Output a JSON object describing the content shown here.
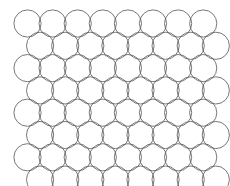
{
  "canvas": {
    "width": 230,
    "height": 186,
    "background_color": "#ffffff"
  },
  "diagram": {
    "shape": "circle",
    "stroke_color": "#555555",
    "stroke_width": 0.8,
    "fill": "none",
    "radius": 13.6,
    "row_count": 8,
    "columns_per_row": 8,
    "x_pitch": 25.1,
    "y_pitch": 22.3,
    "origin_x": 27.5,
    "origin_y": 23.5,
    "odd_row_offset": 12.55,
    "lattice": "hexagonal-close-packed",
    "total_circles": 64
  },
  "chart_data": {
    "type": "scatter",
    "title": "",
    "xlabel": "",
    "ylabel": "",
    "grid": false,
    "legend": null,
    "xlim": [
      0,
      230
    ],
    "ylim": [
      0,
      186
    ],
    "marker": "open-circle",
    "marker_radius": 13.6,
    "centers": [
      [
        27.5,
        23.5
      ],
      [
        52.6,
        23.5
      ],
      [
        77.7,
        23.5
      ],
      [
        102.8,
        23.5
      ],
      [
        127.9,
        23.5
      ],
      [
        153.0,
        23.5
      ],
      [
        178.1,
        23.5
      ],
      [
        203.2,
        23.5
      ],
      [
        40.1,
        45.8
      ],
      [
        65.2,
        45.8
      ],
      [
        90.3,
        45.8
      ],
      [
        115.4,
        45.8
      ],
      [
        140.5,
        45.8
      ],
      [
        165.6,
        45.8
      ],
      [
        190.7,
        45.8
      ],
      [
        215.8,
        45.8
      ],
      [
        27.5,
        68.1
      ],
      [
        52.6,
        68.1
      ],
      [
        77.7,
        68.1
      ],
      [
        102.8,
        68.1
      ],
      [
        127.9,
        68.1
      ],
      [
        153.0,
        68.1
      ],
      [
        178.1,
        68.1
      ],
      [
        203.2,
        68.1
      ],
      [
        40.1,
        90.4
      ],
      [
        65.2,
        90.4
      ],
      [
        90.3,
        90.4
      ],
      [
        115.4,
        90.4
      ],
      [
        140.5,
        90.4
      ],
      [
        165.6,
        90.4
      ],
      [
        190.7,
        90.4
      ],
      [
        215.8,
        90.4
      ],
      [
        27.5,
        112.7
      ],
      [
        52.6,
        112.7
      ],
      [
        77.7,
        112.7
      ],
      [
        102.8,
        112.7
      ],
      [
        127.9,
        112.7
      ],
      [
        153.0,
        112.7
      ],
      [
        178.1,
        112.7
      ],
      [
        203.2,
        112.7
      ],
      [
        40.1,
        135.0
      ],
      [
        65.2,
        135.0
      ],
      [
        90.3,
        135.0
      ],
      [
        115.4,
        135.0
      ],
      [
        140.5,
        135.0
      ],
      [
        165.6,
        135.0
      ],
      [
        190.7,
        135.0
      ],
      [
        215.8,
        135.0
      ],
      [
        27.5,
        157.3
      ],
      [
        52.6,
        157.3
      ],
      [
        77.7,
        157.3
      ],
      [
        102.8,
        157.3
      ],
      [
        127.9,
        157.3
      ],
      [
        153.0,
        157.3
      ],
      [
        178.1,
        157.3
      ],
      [
        203.2,
        157.3
      ],
      [
        40.1,
        179.6
      ],
      [
        65.2,
        179.6
      ],
      [
        90.3,
        179.6
      ],
      [
        115.4,
        179.6
      ],
      [
        140.5,
        179.6
      ],
      [
        165.6,
        179.6
      ],
      [
        190.7,
        179.6
      ],
      [
        215.8,
        179.6
      ]
    ]
  }
}
